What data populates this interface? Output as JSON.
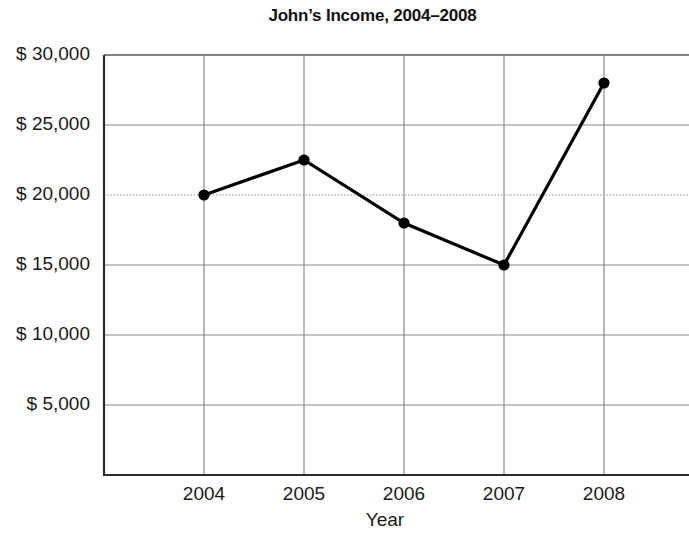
{
  "chart_data": {
    "type": "line",
    "title": "John’s Income, 2004–2008",
    "xlabel": "Year",
    "ylabel": "",
    "categories": [
      "2004",
      "2005",
      "2006",
      "2007",
      "2008"
    ],
    "values": [
      20000,
      22500,
      18000,
      15000,
      28000
    ],
    "series": [
      {
        "name": "Income",
        "values": [
          20000,
          22500,
          18000,
          15000,
          28000
        ]
      }
    ],
    "x_tick_labels": [
      "2004",
      "2005",
      "2006",
      "2007",
      "2008"
    ],
    "y_tick_labels": [
      "$ 30,000",
      "$ 25,000",
      "$ 20,000",
      "$ 15,000",
      "$ 10,000",
      "$ 5,000"
    ],
    "y_tick_values": [
      30000,
      25000,
      20000,
      15000,
      10000,
      5000
    ],
    "ylim": [
      0,
      30000
    ],
    "grid": "both",
    "gridline_styles": {
      "30000": "solid",
      "25000": "solid",
      "20000": "dotted",
      "15000": "solid",
      "10000": "solid",
      "5000": "solid"
    },
    "legend": "none",
    "marker": "filled-circle",
    "line_color": "#000000",
    "marker_color": "#000000",
    "grid_color": "#888888",
    "axis_color": "#333333",
    "background_color": "#ffffff",
    "annotations": []
  }
}
